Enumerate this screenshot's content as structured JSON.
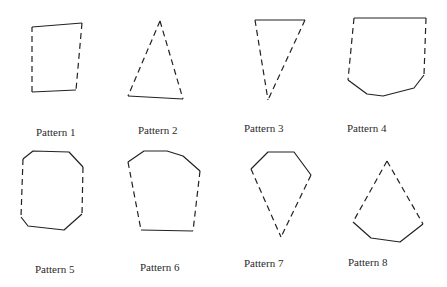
{
  "patterns": [
    {
      "label": "Pattern 1",
      "label_pos": [
        36,
        126
      ],
      "solid": [
        [
          [
            32,
            27
          ],
          [
            82,
            23
          ]
        ],
        [
          [
            76,
            90
          ],
          [
            32,
            92
          ]
        ]
      ],
      "dashed": [
        [
          [
            82,
            23
          ],
          [
            76,
            90
          ]
        ],
        [
          [
            32,
            92
          ],
          [
            32,
            27
          ]
        ]
      ]
    },
    {
      "label": "Pattern 2",
      "label_pos": [
        138,
        124
      ],
      "solid": [
        [
          [
            128,
            96
          ],
          [
            183,
            99
          ]
        ]
      ],
      "dashed": [
        [
          [
            160,
            21
          ],
          [
            128,
            96
          ]
        ],
        [
          [
            160,
            21
          ],
          [
            183,
            99
          ]
        ]
      ]
    },
    {
      "label": "Pattern 3",
      "label_pos": [
        244,
        122
      ],
      "solid": [
        [
          [
            255,
            20
          ],
          [
            305,
            20
          ]
        ]
      ],
      "dashed": [
        [
          [
            255,
            20
          ],
          [
            268,
            100
          ]
        ],
        [
          [
            305,
            20
          ],
          [
            268,
            100
          ]
        ]
      ]
    },
    {
      "label": "Pattern 4",
      "label_pos": [
        347,
        122
      ],
      "solid": [
        [
          [
            354,
            18
          ],
          [
            426,
            18
          ]
        ],
        [
          [
            424,
            75
          ],
          [
            414,
            88
          ],
          [
            383,
            96
          ],
          [
            367,
            94
          ],
          [
            348,
            80
          ]
        ]
      ],
      "dashed": [
        [
          [
            354,
            18
          ],
          [
            348,
            80
          ]
        ],
        [
          [
            426,
            18
          ],
          [
            424,
            75
          ]
        ]
      ]
    },
    {
      "label": "Pattern 5",
      "label_pos": [
        35,
        263
      ],
      "solid": [
        [
          [
            23,
            159
          ],
          [
            33,
            151
          ],
          [
            69,
            152
          ],
          [
            83,
            167
          ]
        ],
        [
          [
            82,
            214
          ],
          [
            64,
            230
          ],
          [
            28,
            226
          ],
          [
            21,
            217
          ]
        ]
      ],
      "dashed": [
        [
          [
            23,
            159
          ],
          [
            21,
            217
          ]
        ],
        [
          [
            83,
            167
          ],
          [
            82,
            214
          ]
        ]
      ]
    },
    {
      "label": "Pattern 6",
      "label_pos": [
        140,
        261
      ],
      "solid": [
        [
          [
            128,
            162
          ],
          [
            144,
            151
          ],
          [
            167,
            151
          ],
          [
            183,
            156
          ],
          [
            200,
            171
          ]
        ],
        [
          [
            193,
            231
          ],
          [
            141,
            230
          ]
        ]
      ],
      "dashed": [
        [
          [
            128,
            162
          ],
          [
            141,
            230
          ]
        ],
        [
          [
            200,
            171
          ],
          [
            193,
            231
          ]
        ]
      ]
    },
    {
      "label": "Pattern 7",
      "label_pos": [
        244,
        257
      ],
      "solid": [
        [
          [
            251,
            169
          ],
          [
            268,
            152
          ],
          [
            294,
            152
          ],
          [
            311,
            175
          ]
        ]
      ],
      "dashed": [
        [
          [
            251,
            169
          ],
          [
            281,
            237
          ]
        ],
        [
          [
            311,
            175
          ],
          [
            281,
            237
          ]
        ]
      ]
    },
    {
      "label": "Pattern 8",
      "label_pos": [
        348,
        256
      ],
      "solid": [
        [
          [
            423,
            224
          ],
          [
            400,
            242
          ],
          [
            371,
            238
          ],
          [
            353,
            222
          ]
        ]
      ],
      "dashed": [
        [
          [
            387,
            161
          ],
          [
            353,
            222
          ]
        ],
        [
          [
            387,
            161
          ],
          [
            423,
            224
          ]
        ]
      ]
    }
  ],
  "style": {
    "stroke": "#222222",
    "dash": "6,4"
  }
}
